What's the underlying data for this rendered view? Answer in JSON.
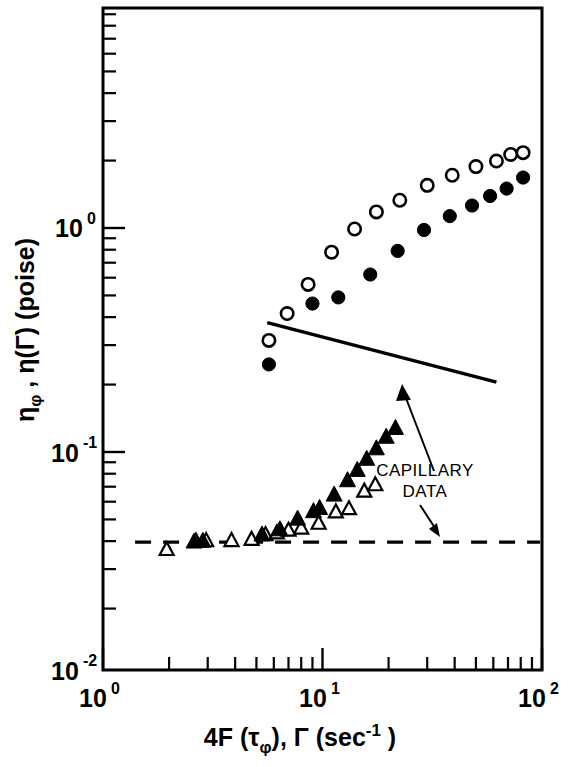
{
  "chart_data": {
    "type": "scatter",
    "title": "",
    "xlabel": "4F (τφ), Γ (sec⁻¹)",
    "ylabel": "ηφ , η(Γ) (poise)",
    "xscale": "log",
    "yscale": "log",
    "xlim": [
      1,
      100
    ],
    "ylim": [
      0.01,
      3.1
    ],
    "grid": false,
    "legend": "none",
    "x_tick_labels": [
      "10⁰",
      "10¹",
      "10²"
    ],
    "x_tick_values": [
      1,
      10,
      100
    ],
    "y_tick_labels": [
      "10⁰",
      "10⁻¹",
      "10⁻²"
    ],
    "y_tick_values": [
      1,
      0.1,
      0.01
    ],
    "series": [
      {
        "name": "open-circle-series",
        "marker": "open-circle",
        "points": [
          [
            5.7,
            0.315
          ],
          [
            6.9,
            0.415
          ],
          [
            8.6,
            0.56
          ],
          [
            11.0,
            0.78
          ],
          [
            14.0,
            0.99
          ],
          [
            17.6,
            1.18
          ],
          [
            22.5,
            1.33
          ],
          [
            30.0,
            1.55
          ],
          [
            39.0,
            1.72
          ],
          [
            50.0,
            1.88
          ],
          [
            62.0,
            1.99
          ],
          [
            72.0,
            2.13
          ],
          [
            82.0,
            2.17
          ]
        ]
      },
      {
        "name": "filled-circle-series",
        "marker": "filled-circle",
        "points": [
          [
            5.7,
            0.246
          ],
          [
            9.0,
            0.46
          ],
          [
            11.8,
            0.49
          ],
          [
            16.5,
            0.62
          ],
          [
            22.0,
            0.79
          ],
          [
            29.0,
            0.98
          ],
          [
            38.0,
            1.13
          ],
          [
            48.0,
            1.26
          ],
          [
            58.0,
            1.39
          ],
          [
            69.0,
            1.5
          ],
          [
            82.0,
            1.68
          ]
        ]
      },
      {
        "name": "open-triangle-series",
        "marker": "open-triangle",
        "points": [
          [
            1.95,
            0.0365
          ],
          [
            2.65,
            0.0398
          ],
          [
            2.95,
            0.04
          ],
          [
            3.85,
            0.04
          ],
          [
            4.75,
            0.0405
          ],
          [
            5.5,
            0.0425
          ],
          [
            6.2,
            0.0433
          ],
          [
            7.0,
            0.0445
          ],
          [
            8.0,
            0.0455
          ],
          [
            9.6,
            0.0478
          ],
          [
            11.5,
            0.0537
          ],
          [
            13.2,
            0.0555
          ],
          [
            15.5,
            0.0665
          ],
          [
            17.4,
            0.071
          ]
        ]
      },
      {
        "name": "filled-triangle-series",
        "marker": "filled-triangle",
        "points": [
          [
            2.6,
            0.0395
          ],
          [
            2.85,
            0.0398
          ],
          [
            5.3,
            0.0425
          ],
          [
            6.4,
            0.0448
          ],
          [
            7.7,
            0.05
          ],
          [
            9.1,
            0.054
          ],
          [
            9.7,
            0.0558
          ],
          [
            11.3,
            0.064
          ],
          [
            13.0,
            0.0742
          ],
          [
            14.4,
            0.0825
          ],
          [
            15.9,
            0.0925
          ],
          [
            17.6,
            0.103
          ],
          [
            19.5,
            0.116
          ],
          [
            21.5,
            0.127
          ]
        ]
      }
    ],
    "reference_lines": [
      {
        "name": "capillary-data-solid-line",
        "style": "solid",
        "x": [
          5.6,
          62.0
        ],
        "y": [
          0.378,
          0.205
        ]
      },
      {
        "name": "capillary-data-dashed-line",
        "style": "dashed",
        "x": [
          1.4,
          98.0
        ],
        "y": [
          0.0396,
          0.0396
        ]
      }
    ],
    "annotations": [
      {
        "name": "capillary-data-label",
        "line1": "CAPILLARY",
        "line2": "DATA",
        "arrows": [
          {
            "name": "arrow-to-solid-line",
            "target": "capillary-data-solid-line"
          },
          {
            "name": "arrow-to-dashed-line",
            "target": "capillary-data-dashed-line"
          }
        ]
      }
    ]
  },
  "axes": {
    "y_title_main": "η",
    "y_title_sub1": "φ",
    "y_title_mid": " , η(Γ) (poise)",
    "x_title_a": "4F (τ",
    "x_title_a_sub": "φ",
    "x_title_b": "), Γ (sec",
    "x_title_b_sup": "-1",
    "x_title_c": " )",
    "x_labels": [
      {
        "base": "10",
        "exp": "0"
      },
      {
        "base": "10",
        "exp": "1"
      },
      {
        "base": "10",
        "exp": "2"
      }
    ],
    "y_labels": [
      {
        "base": "10",
        "exp": "0"
      },
      {
        "base": "10",
        "exp": "-1"
      },
      {
        "base": "10",
        "exp": "-2"
      }
    ]
  },
  "annotation": {
    "capillary_line1": "CAPILLARY",
    "capillary_line2": "DATA"
  },
  "colors": {
    "ink": "#000000",
    "paper": "#ffffff"
  }
}
